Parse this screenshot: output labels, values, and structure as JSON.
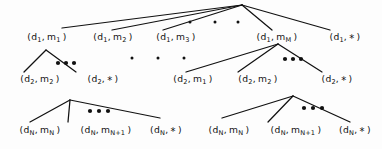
{
  "figure": {
    "type": "tree-diagram",
    "background_color": "#fdfdfd",
    "line_color": "#111111",
    "text_color": "#111111"
  },
  "nodes": {
    "level1": [
      {
        "id": "l1-n1",
        "d": "d",
        "d_sub": "1",
        "m": "m",
        "m_sub": "1",
        "text": "(d 1 , m 1 )",
        "x": 47,
        "y": 38
      },
      {
        "id": "l1-n2",
        "d": "d",
        "d_sub": "1",
        "m": "m",
        "m_sub": "2",
        "text": "(d 1 , m 2 )",
        "x": 113,
        "y": 38
      },
      {
        "id": "l1-n3",
        "d": "d",
        "d_sub": "1",
        "m": "m",
        "m_sub": "3",
        "text": "(d 1 , m 3 )",
        "x": 176,
        "y": 38
      },
      {
        "id": "l1-n4",
        "d": "d",
        "d_sub": "1",
        "m": "m",
        "m_sub": "M",
        "text": "(d 1 , m M )",
        "x": 277,
        "y": 38
      },
      {
        "id": "l1-n5",
        "d": "d",
        "d_sub": "1",
        "m": "*",
        "m_sub": "",
        "text": "(d 1 , * )",
        "x": 345,
        "y": 38
      }
    ],
    "level2_left": [
      {
        "id": "l2a-n1",
        "d": "d",
        "d_sub": "2",
        "m": "m",
        "m_sub": "2",
        "text": "(d 2 , m 2 )",
        "x": 40,
        "y": 80
      },
      {
        "id": "l2a-n2",
        "d": "d",
        "d_sub": "2",
        "m": "*",
        "m_sub": "",
        "text": "(d 2 , * )",
        "x": 103,
        "y": 80
      }
    ],
    "level2_right": [
      {
        "id": "l2b-n1",
        "d": "d",
        "d_sub": "2",
        "m": "m",
        "m_sub": "1",
        "text": "(d 2 , m 1 )",
        "x": 193,
        "y": 80
      },
      {
        "id": "l2b-n2",
        "d": "d",
        "d_sub": "2",
        "m": "m",
        "m_sub": "2",
        "text": "(d 2 , m 2 )",
        "x": 258,
        "y": 80
      },
      {
        "id": "l2b-n3",
        "d": "d",
        "d_sub": "2",
        "m": "*",
        "m_sub": "",
        "text": "(d 2 , * )",
        "x": 337,
        "y": 80
      }
    ],
    "level3_left": [
      {
        "id": "l3a-n1",
        "d": "d",
        "d_sub": "N",
        "m": "m",
        "m_sub": "N",
        "text": "(d N , m N )",
        "x": 40,
        "y": 131
      },
      {
        "id": "l3a-n2",
        "d": "d",
        "d_sub": "N",
        "m": "m",
        "m_sub": "N+1",
        "text": "(d N , m N+1 )",
        "x": 106,
        "y": 131
      },
      {
        "id": "l3a-n3",
        "d": "d",
        "d_sub": "N",
        "m": "*",
        "m_sub": "",
        "text": "(d N , * )",
        "x": 166,
        "y": 131
      }
    ],
    "level3_right": [
      {
        "id": "l3b-n1",
        "d": "d",
        "d_sub": "N",
        "m": "m",
        "m_sub": "N",
        "text": "(d N , m N )",
        "x": 229,
        "y": 131
      },
      {
        "id": "l3b-n2",
        "d": "d",
        "d_sub": "N",
        "m": "m",
        "m_sub": "N+1",
        "text": "(d N , m N+1 )",
        "x": 296,
        "y": 131
      },
      {
        "id": "l3b-n3",
        "d": "d",
        "d_sub": "N",
        "m": "*",
        "m_sub": "",
        "text": "(d N , * )",
        "x": 355,
        "y": 131
      }
    ]
  },
  "edges": {
    "root": {
      "apex_x": 242,
      "apex_y": 5,
      "targets": [
        [
          62,
          28
        ],
        [
          112,
          30
        ],
        [
          163,
          30
        ],
        [
          272,
          30
        ],
        [
          330,
          30
        ]
      ]
    },
    "subtree_left_1": {
      "apex_x": 46,
      "apex_y": 50,
      "targets": [
        [
          24,
          72
        ],
        [
          76,
          72
        ]
      ]
    },
    "subtree_right_1": {
      "apex_x": 278,
      "apex_y": 44,
      "targets": [
        [
          186,
          72
        ],
        [
          238,
          72
        ],
        [
          322,
          72
        ]
      ]
    },
    "subtree_left_2": {
      "apex_x": 70,
      "apex_y": 100,
      "targets": [
        [
          30,
          122
        ],
        [
          68,
          122
        ],
        [
          160,
          118
        ]
      ]
    },
    "subtree_right_2": {
      "apex_x": 293,
      "apex_y": 96,
      "targets": [
        [
          222,
          118
        ],
        [
          268,
          122
        ],
        [
          350,
          122
        ]
      ]
    }
  },
  "ellipses": {
    "root_small_dots": {
      "radius": 1.5,
      "points": [
        [
          190,
          22
        ],
        [
          215,
          22
        ],
        [
          238,
          22
        ]
      ]
    },
    "mid_small_dots": {
      "radius": 1.5,
      "points": [
        [
          132,
          58
        ],
        [
          158,
          58
        ],
        [
          184,
          58
        ]
      ]
    },
    "bold_dots_left_1": {
      "radius": 2.1,
      "points": [
        [
          58,
          63
        ],
        [
          66,
          63
        ],
        [
          74,
          63
        ]
      ]
    },
    "bold_dots_right_1": {
      "radius": 2.1,
      "points": [
        [
          285,
          59
        ],
        [
          293,
          59
        ],
        [
          301,
          59
        ]
      ]
    },
    "bold_dots_left_2": {
      "radius": 2.1,
      "points": [
        [
          90,
          111
        ],
        [
          99,
          111
        ],
        [
          108,
          111
        ]
      ]
    },
    "bold_dots_right_2": {
      "radius": 2.1,
      "points": [
        [
          304,
          108
        ],
        [
          313,
          108
        ],
        [
          322,
          108
        ]
      ]
    }
  }
}
